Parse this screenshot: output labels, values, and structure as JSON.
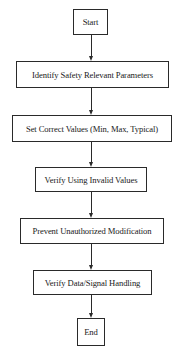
{
  "diagram": {
    "type": "flowchart",
    "direction": "top-to-bottom",
    "nodes": [
      {
        "id": "start",
        "label": "Start",
        "shape": "rectangle"
      },
      {
        "id": "identify",
        "label": "Identify Safety Relevant Parameters",
        "shape": "rectangle"
      },
      {
        "id": "set_values",
        "label": "Set Correct Values (Min, Max, Typical)",
        "shape": "rectangle"
      },
      {
        "id": "verify_invalid",
        "label": "Verify Using Invalid Values",
        "shape": "rectangle"
      },
      {
        "id": "prevent",
        "label": "Prevent Unauthorized Modification",
        "shape": "rectangle"
      },
      {
        "id": "verify_data",
        "label": "Verify Data/Signal Handling",
        "shape": "rectangle"
      },
      {
        "id": "end",
        "label": "End",
        "shape": "rectangle"
      }
    ],
    "edges": [
      {
        "from": "start",
        "to": "identify"
      },
      {
        "from": "identify",
        "to": "set_values"
      },
      {
        "from": "set_values",
        "to": "verify_invalid"
      },
      {
        "from": "verify_invalid",
        "to": "prevent"
      },
      {
        "from": "prevent",
        "to": "verify_data"
      },
      {
        "from": "verify_data",
        "to": "end"
      }
    ],
    "colors": {
      "stroke": "#2a2a2a",
      "fill": "#ffffff",
      "text": "#1a1a1a"
    }
  }
}
